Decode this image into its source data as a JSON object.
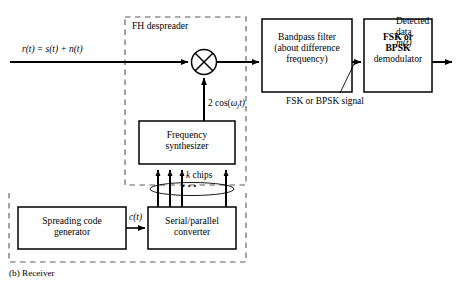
{
  "figure": {
    "caption": "(b) Receiver",
    "inner_group_label": "FH despreader"
  },
  "signals": {
    "input": {
      "r": "r",
      "eq": "(t) = ",
      "s": "s",
      "st": "(t) + ",
      "n": "n",
      "nt": "(t)",
      "full": "r(t) = s(t) + n(t)"
    },
    "lo": {
      "prefix": "2 cos(",
      "omega": "ω",
      "sub": "j",
      "suffix": "t)",
      "full": "2 cos(ωⱼt)"
    },
    "mid": {
      "label": "FSK or BPSK signal"
    },
    "chips": {
      "k": "k",
      "word": " chips",
      "dots": "• • •",
      "full": "k chips"
    },
    "code": {
      "c": "c",
      "t": "(t)",
      "full": "c(t)"
    },
    "output": {
      "line1": "Detected",
      "line2": "data",
      "m": "m",
      "tilde": "~",
      "t": "(t)",
      "full": "Detected data m̃(t)"
    }
  },
  "blocks": [
    {
      "id": "bandpass-filter",
      "lines": [
        "Bandpass filter",
        "(about difference",
        "frequency)"
      ]
    },
    {
      "id": "demodulator",
      "lines": [
        "FSK or",
        "BPSK",
        "demodulator"
      ]
    },
    {
      "id": "frequency-synthesizer",
      "lines": [
        "Frequency",
        "synthesizer"
      ]
    },
    {
      "id": "spreading-code-generator",
      "lines": [
        "Spreading code",
        "generator"
      ]
    },
    {
      "id": "serial-parallel-converter",
      "lines": [
        "Serial/parallel",
        "converter"
      ]
    }
  ],
  "colors": {
    "ink": "#000000",
    "paper": "#ffffff",
    "dash": "#555555"
  }
}
